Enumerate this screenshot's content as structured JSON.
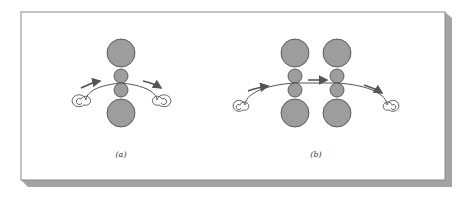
{
  "figure": {
    "panels": [
      {
        "id": "a",
        "label": "(a)",
        "description": "Single roll stand: two large backup rolls with two small work rolls; strip passes between work rolls from left coil to right coil",
        "stands": 1
      },
      {
        "id": "b",
        "label": "(b)",
        "description": "Tandem arrangement: two roll stands in series, strip passes through both from left coil to right coil",
        "stands": 2
      }
    ],
    "colors": {
      "roll_fill": "#9d9d9d",
      "roll_stroke": "#444444",
      "strip": "#555555",
      "arrow": "#555555",
      "frame_border": "#777777",
      "frame_shadow": "#a3a3a3",
      "background": "#ffffff"
    }
  }
}
